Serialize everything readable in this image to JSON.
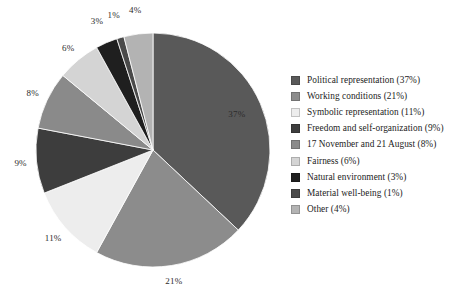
{
  "chart_data": {
    "type": "pie",
    "title": "",
    "subtitle": "",
    "xlabel": "",
    "ylabel": "",
    "grid": false,
    "legend_position": "right",
    "start_angle_deg": 0,
    "direction": "clockwise",
    "units": "percent",
    "total": 100,
    "categories": [
      "Political representation",
      "Working conditions",
      "Symbolic representation",
      "Freedom and self-organization",
      "17 November and 21 August",
      "Fairness",
      "Natural environment",
      "Material well-being",
      "Other"
    ],
    "values": [
      37,
      21,
      11,
      9,
      8,
      6,
      3,
      1,
      4
    ],
    "data_labels": [
      "37%",
      "21%",
      "11%",
      "9%",
      "8%",
      "6%",
      "3%",
      "1%",
      "4%"
    ],
    "colors": [
      "#595959",
      "#8c8c8c",
      "#ededed",
      "#3d3d3d",
      "#8a8a8a",
      "#d4d4d4",
      "#1f1f1f",
      "#4a4a4a",
      "#b3b3b3"
    ],
    "slices": [
      {
        "label": "Political representation",
        "value": 37,
        "data_label": "37%",
        "color": "#595959",
        "legend_label": "Political representation (37%)"
      },
      {
        "label": "Working conditions",
        "value": 21,
        "data_label": "21%",
        "color": "#8c8c8c",
        "legend_label": "Working conditions (21%)"
      },
      {
        "label": "Symbolic representation",
        "value": 11,
        "data_label": "11%",
        "color": "#ededed",
        "legend_label": "Symbolic representation (11%)"
      },
      {
        "label": "Freedom and self-organization",
        "value": 9,
        "data_label": "9%",
        "color": "#3d3d3d",
        "legend_label": "Freedom and self-organization (9%)"
      },
      {
        "label": "17 November and 21 August",
        "value": 8,
        "data_label": "8%",
        "color": "#8a8a8a",
        "legend_label": "17 November and 21 August (8%)"
      },
      {
        "label": "Fairness",
        "value": 6,
        "data_label": "6%",
        "color": "#d4d4d4",
        "legend_label": "Fairness (6%)"
      },
      {
        "label": "Natural environment",
        "value": 3,
        "data_label": "3%",
        "color": "#1f1f1f",
        "legend_label": "Natural environment (3%)"
      },
      {
        "label": "Material well-being",
        "value": 1,
        "data_label": "1%",
        "color": "#4a4a4a",
        "legend_label": "Material well-being (1%)"
      },
      {
        "label": "Other",
        "value": 4,
        "data_label": "4%",
        "color": "#b3b3b3",
        "legend_label": "Other (4%)"
      }
    ]
  },
  "geometry": {
    "center_x": 153,
    "center_y": 150,
    "radius": 117,
    "label_radius": 133
  },
  "legend": {
    "items": [
      {
        "label": "Political representation (37%)",
        "color": "#595959"
      },
      {
        "label": "Working conditions (21%)",
        "color": "#8c8c8c"
      },
      {
        "label": "Symbolic representation (11%)",
        "color": "#ededed"
      },
      {
        "label": "Freedom and self-organization (9%)",
        "color": "#3d3d3d"
      },
      {
        "label": "17 November and 21 August (8%)",
        "color": "#8a8a8a"
      },
      {
        "label": "Fairness (6%)",
        "color": "#d4d4d4"
      },
      {
        "label": "Natural environment (3%)",
        "color": "#1f1f1f"
      },
      {
        "label": "Material well-being (1%)",
        "color": "#4a4a4a"
      },
      {
        "label": "Other (4%)",
        "color": "#b3b3b3"
      }
    ]
  }
}
